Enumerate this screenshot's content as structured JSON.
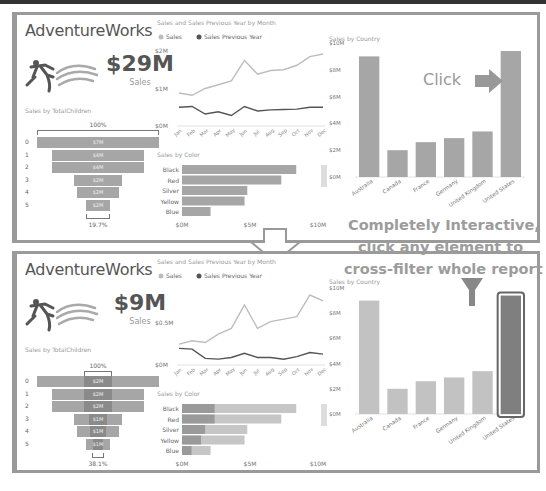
{
  "callout": {
    "line1": "Completely Interactive,",
    "line2": "click any element to",
    "line3": "cross-filter whole report",
    "click_label": "Click"
  },
  "colors": {
    "bar": "#a6a6a6",
    "bar_highlight": "#7f7f7f",
    "sales_line": "#bdbdbd",
    "prev_line": "#555555",
    "border": "#9a9a9a"
  },
  "panels": [
    {
      "title": "AdventureWorks",
      "kpi": {
        "value": "$29M",
        "label": "Sales"
      },
      "funnel": {
        "title": "Sales by TotalChildren",
        "top_pct": "100%",
        "bottom_pct": "19.7%",
        "rows": [
          {
            "cat": "0",
            "label": "$7M",
            "value": 7,
            "highlight": 0
          },
          {
            "cat": "1",
            "label": "$4M",
            "value": 5.3,
            "highlight": 0
          },
          {
            "cat": "2",
            "label": "$4M",
            "value": 5.3,
            "highlight": 0
          },
          {
            "cat": "3",
            "label": "$2M",
            "value": 2.7,
            "highlight": 0
          },
          {
            "cat": "4",
            "label": "$2M",
            "value": 2.4,
            "highlight": 0
          },
          {
            "cat": "5",
            "label": "$2M",
            "value": 1.4,
            "highlight": 0
          }
        ]
      },
      "line_chart": {
        "title": "Sales and Sales Previous Year by Month",
        "legend": [
          "Sales",
          "Sales Previous Year"
        ],
        "yticks": [
          "$2M",
          "$1M",
          "$0M"
        ],
        "months": [
          "Jan",
          "Feb",
          "Mar",
          "Apr",
          "May",
          "Jun",
          "Jul",
          "Aug",
          "Sep",
          "Oct",
          "Nov",
          "Dec"
        ]
      },
      "color_chart": {
        "title": "Sales by Color",
        "categories": [
          "Black",
          "Red",
          "Silver",
          "Yellow",
          "Blue"
        ],
        "values": [
          8.4,
          7.3,
          4.8,
          4.6,
          2.1
        ],
        "highlight": [
          0,
          0,
          0,
          0,
          0
        ],
        "xticks": [
          "$0M",
          "$5M",
          "$10M"
        ]
      },
      "country_chart": {
        "title": "Sales by Country",
        "yticks": [
          "$10M",
          "$8M",
          "$6M",
          "$4M",
          "$2M",
          "$0M"
        ],
        "categories": [
          "Australia",
          "Canada",
          "France",
          "Germany",
          "United Kingdom",
          "United States"
        ],
        "values": [
          9.0,
          2.0,
          2.6,
          2.9,
          3.4,
          9.4
        ],
        "selected": -1
      }
    },
    {
      "title": "AdventureWorks",
      "kpi": {
        "value": "$9M",
        "label": "Sales"
      },
      "funnel": {
        "title": "Sales by TotalChildren",
        "top_pct": "100%",
        "bottom_pct": "38.1%",
        "rows": [
          {
            "cat": "0",
            "label": "$2M",
            "value": 7,
            "highlight": 1.6
          },
          {
            "cat": "1",
            "label": "$2M",
            "value": 5.3,
            "highlight": 1.6
          },
          {
            "cat": "2",
            "label": "$2M",
            "value": 5.3,
            "highlight": 1.6
          },
          {
            "cat": "3",
            "label": "$1M",
            "value": 2.7,
            "highlight": 1.0
          },
          {
            "cat": "4",
            "label": "$1M",
            "value": 2.4,
            "highlight": 0.9
          },
          {
            "cat": "5",
            "label": "$1M",
            "value": 1.4,
            "highlight": 0.6
          }
        ]
      },
      "line_chart": {
        "title": "Sales and Sales Previous Year by Month",
        "legend": [
          "Sales",
          "Sales Previous Year"
        ],
        "yticks": [
          "$0.5M",
          "$0M"
        ],
        "months": [
          "Jan",
          "Feb",
          "Mar",
          "Apr",
          "May",
          "Jun",
          "Jul",
          "Aug",
          "Sep",
          "Oct",
          "Nov",
          "Dec"
        ]
      },
      "color_chart": {
        "title": "Sales by Color",
        "categories": [
          "Black",
          "Red",
          "Silver",
          "Yellow",
          "Blue"
        ],
        "values": [
          8.4,
          7.3,
          4.8,
          4.6,
          2.1
        ],
        "highlight": [
          2.4,
          2.4,
          1.7,
          1.4,
          0.7
        ],
        "xticks": [
          "$0M",
          "$5M",
          "$10M"
        ]
      },
      "country_chart": {
        "title": "Sales by Country",
        "yticks": [
          "$10M",
          "$8M",
          "$6M",
          "$4M",
          "$2M",
          "$0M"
        ],
        "categories": [
          "Australia",
          "Canada",
          "France",
          "Germany",
          "United Kingdom",
          "United States"
        ],
        "values": [
          9.0,
          2.0,
          2.6,
          2.9,
          3.4,
          9.4
        ],
        "selected": 5
      }
    }
  ],
  "chart_data": [
    {
      "type": "line",
      "title": "Sales and Sales Previous Year by Month (unfiltered)",
      "x": [
        "Jan",
        "Feb",
        "Mar",
        "Apr",
        "May",
        "Jun",
        "Jul",
        "Aug",
        "Sep",
        "Oct",
        "Nov",
        "Dec"
      ],
      "series": [
        {
          "name": "Sales",
          "values": [
            0.88,
            0.82,
            1.0,
            1.1,
            1.2,
            1.75,
            1.38,
            1.48,
            1.5,
            1.62,
            1.85,
            1.92
          ]
        },
        {
          "name": "Sales Previous Year",
          "values": [
            0.5,
            0.52,
            0.32,
            0.38,
            0.28,
            0.52,
            0.4,
            0.43,
            0.44,
            0.45,
            0.5,
            0.5
          ]
        }
      ],
      "ylim": [
        0,
        2
      ],
      "yticks": [
        "$0M",
        "$1M",
        "$2M"
      ],
      "legend": "top-left"
    },
    {
      "type": "line",
      "title": "Sales and Sales Previous Year by Month (United States filter)",
      "x": [
        "Jan",
        "Feb",
        "Mar",
        "Apr",
        "May",
        "Jun",
        "Jul",
        "Aug",
        "Sep",
        "Oct",
        "Nov",
        "Dec"
      ],
      "series": [
        {
          "name": "Sales",
          "values": [
            0.25,
            0.29,
            0.27,
            0.37,
            0.44,
            0.72,
            0.44,
            0.52,
            0.55,
            0.58,
            0.84,
            0.77
          ]
        },
        {
          "name": "Sales Previous Year",
          "values": [
            0.2,
            0.19,
            0.08,
            0.07,
            0.09,
            0.14,
            0.09,
            0.09,
            0.07,
            0.1,
            0.15,
            0.13
          ]
        }
      ],
      "ylim": [
        0,
        0.9
      ],
      "yticks": [
        "$0M",
        "$0.5M"
      ],
      "legend": "top-left"
    },
    {
      "type": "bar",
      "title": "Sales by Country",
      "categories": [
        "Australia",
        "Canada",
        "France",
        "Germany",
        "United Kingdom",
        "United States"
      ],
      "values": [
        9.0,
        2.0,
        2.6,
        2.9,
        3.4,
        9.4
      ],
      "ylim": [
        0,
        10
      ],
      "ylabel": "",
      "xlabel": ""
    },
    {
      "type": "bar",
      "title": "Sales by Color",
      "categories": [
        "Black",
        "Red",
        "Silver",
        "Yellow",
        "Blue"
      ],
      "series": [
        {
          "name": "Total",
          "values": [
            8.4,
            7.3,
            4.8,
            4.6,
            2.1
          ]
        },
        {
          "name": "United States (filtered)",
          "values": [
            2.4,
            2.4,
            1.7,
            1.4,
            0.7
          ]
        }
      ],
      "xlim": [
        0,
        10
      ]
    }
  ]
}
